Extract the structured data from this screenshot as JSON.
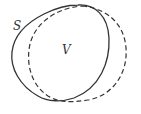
{
  "diagram": {
    "labels": {
      "solid_curve": "S",
      "dashed_curve": "V"
    },
    "colors": {
      "stroke": "#333333",
      "background": "#ffffff"
    }
  }
}
